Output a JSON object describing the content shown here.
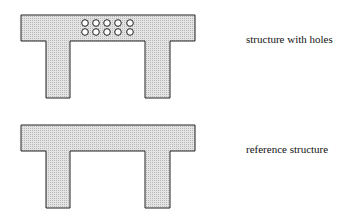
{
  "diagram": {
    "figures": [
      {
        "id": "structure-with-holes",
        "label": "structure with holes",
        "holes": {
          "rows": 2,
          "cols": 5
        }
      },
      {
        "id": "reference-structure",
        "label": "reference structure",
        "holes": {
          "rows": 0,
          "cols": 0
        }
      }
    ],
    "colors": {
      "fill": "#d6d6d6",
      "stroke": "#222222"
    }
  }
}
